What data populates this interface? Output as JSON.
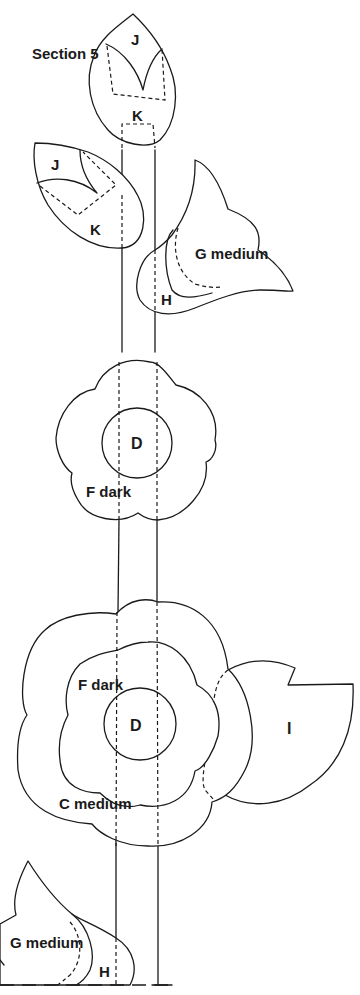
{
  "title": "Section 5",
  "pieces": {
    "bud_top": {
      "upper_label": "J",
      "lower_label": "K"
    },
    "bud_left": {
      "upper_label": "J",
      "lower_label": "K"
    },
    "tulip_upper": {
      "label": "G medium",
      "base_label": "H"
    },
    "flower_upper": {
      "center_label": "D",
      "outer_label": "F dark"
    },
    "flower_lower": {
      "center_label": "D",
      "inner_label": "F dark",
      "outer_label": "C medium"
    },
    "leaf_right": {
      "label": "I"
    },
    "tulip_lower": {
      "label": "G medium",
      "base_label": "H"
    }
  },
  "colors": {
    "line": "#1a1a1a",
    "background": "#ffffff"
  }
}
